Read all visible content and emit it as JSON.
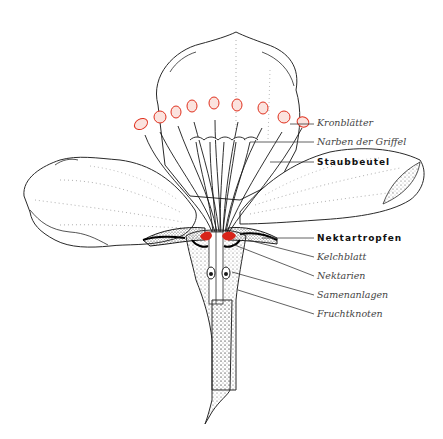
{
  "diagram": {
    "colors": {
      "line": "#2a2a2a",
      "stipple": "#8a8a8a",
      "anther": "#e0301e",
      "nectar": "#d8241a",
      "background": "#ffffff"
    },
    "labels": [
      {
        "id": "kronblaetter",
        "text": "Kronblätter",
        "style": "italic",
        "y": 122
      },
      {
        "id": "narben",
        "text": "Narben der Griffel",
        "style": "italic",
        "y": 141
      },
      {
        "id": "staubbeutel",
        "text": "Staubbeutel",
        "style": "bold",
        "y": 160
      },
      {
        "id": "nektartropfen",
        "text": "Nektartropfen",
        "style": "bold",
        "y": 236
      },
      {
        "id": "kelchblatt",
        "text": "Kelchblatt",
        "style": "italic",
        "y": 255
      },
      {
        "id": "nektarien",
        "text": "Nektarien",
        "style": "italic",
        "y": 274
      },
      {
        "id": "samenanlagen",
        "text": "Samenanlagen",
        "style": "italic",
        "y": 293
      },
      {
        "id": "fruchtknoten",
        "text": "Fruchtknoten",
        "style": "italic",
        "y": 312
      }
    ]
  }
}
